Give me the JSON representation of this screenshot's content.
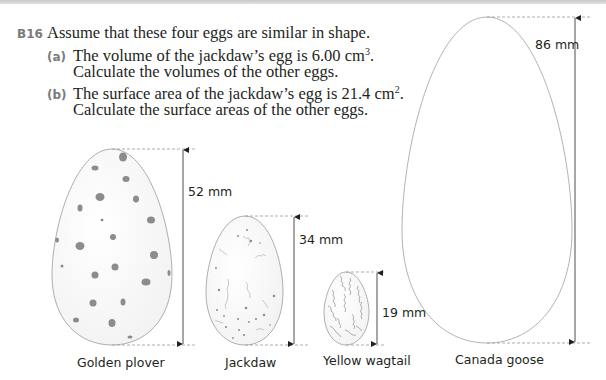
{
  "question": {
    "number": "B16",
    "stem": "Assume that these four eggs are similar in shape.",
    "parts": [
      {
        "label": "(a)",
        "line1_pre": "The volume of the jackdaw’s egg is 6.00 cm",
        "line1_sup": "3",
        "line1_post": ".",
        "line2": "Calculate the volumes of the other eggs."
      },
      {
        "label": "(b)",
        "line1_pre": "The surface area of the jackdaw’s egg is 21.4 cm",
        "line1_sup": "2",
        "line1_post": ".",
        "line2": "Calculate the surface areas of the other eggs."
      }
    ]
  },
  "eggs": [
    {
      "name": "Golden plover",
      "height_label": "52 mm",
      "height_mm": 52,
      "pattern": "blotches"
    },
    {
      "name": "Jackdaw",
      "height_label": "34 mm",
      "height_mm": 34,
      "pattern": "speckles-and-veins"
    },
    {
      "name": "Yellow wagtail",
      "height_label": "19 mm",
      "height_mm": 19,
      "pattern": "dense-squiggles"
    },
    {
      "name": "Canada goose",
      "height_label": "86 mm",
      "height_mm": 86,
      "pattern": "plain"
    }
  ],
  "colors": {
    "text": "#231f20",
    "label_gray": "#7a7a7a",
    "egg_outline": "#9a9a9a",
    "egg_markings": "#8c8c8c",
    "dashed": "#9a9a9a"
  }
}
